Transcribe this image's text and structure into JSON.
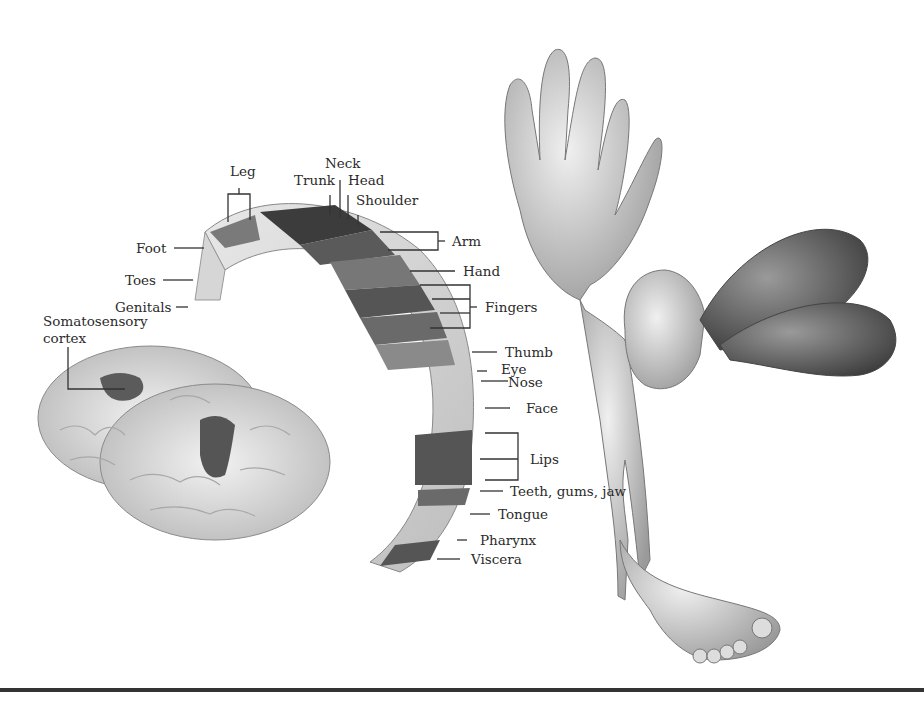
{
  "figure": {
    "labels": {
      "leg": "Leg",
      "neck": "Neck",
      "trunk": "Trunk",
      "head": "Head",
      "shoulder": "Shoulder",
      "foot": "Foot",
      "toes": "Toes",
      "genitals": "Genitals",
      "arm": "Arm",
      "hand": "Hand",
      "fingers": "Fingers",
      "thumb": "Thumb",
      "eye": "Eye",
      "nose": "Nose",
      "face": "Face",
      "lips": "Lips",
      "teeth": "Teeth, gums, jaw",
      "tongue": "Tongue",
      "pharynx": "Pharynx",
      "viscera": "Viscera",
      "cortex_line1": "Somatosensory",
      "cortex_line2": "cortex"
    }
  }
}
